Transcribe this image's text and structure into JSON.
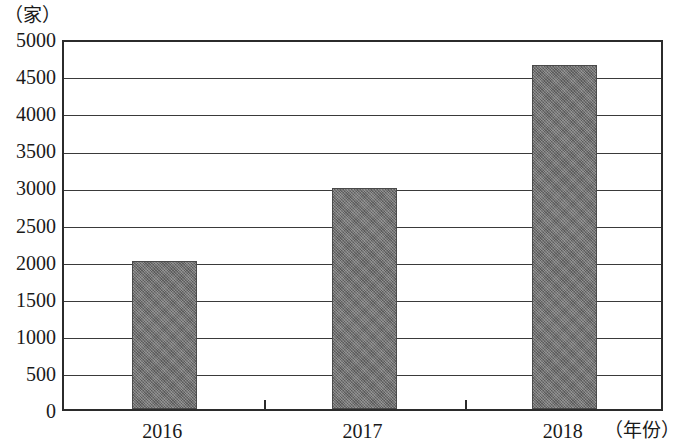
{
  "chart_data": {
    "type": "bar",
    "title": "",
    "subtitle": "",
    "xlabel": "（年份）",
    "ylabel": "（家）",
    "categories": [
      "2016",
      "2017",
      "2018"
    ],
    "values": [
      2000,
      2980,
      4630
    ],
    "series": [
      {
        "name": "",
        "values": [
          2000,
          2980,
          4630
        ]
      }
    ],
    "ylim": [
      0,
      5000
    ],
    "ytick_step": 500,
    "ytick_labels": [
      "0",
      "500",
      "1000",
      "1500",
      "2000",
      "2500",
      "3000",
      "3500",
      "4000",
      "4500",
      "5000"
    ],
    "ytick_values": [
      0,
      500,
      1000,
      1500,
      2000,
      2500,
      3000,
      3500,
      4000,
      4500,
      5000
    ],
    "xtick_labels": [
      "2016",
      "2017",
      "2018"
    ],
    "grid": true,
    "grid_axis": "y",
    "legend": false,
    "legend_position": "none",
    "bar_color": "#6e6e6e",
    "bar_edge_color": "#4a4a4a",
    "axis_color": "#2b2b2b",
    "grid_color": "#3a3a3a",
    "background_color": "#ffffff",
    "annotations": []
  }
}
